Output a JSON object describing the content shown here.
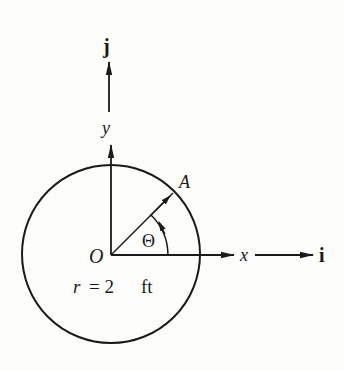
{
  "diagram": {
    "type": "geometry",
    "labels": {
      "unit_j": "j",
      "axis_y": "y",
      "point_A": "A",
      "angle": "Θ",
      "origin": "O",
      "axis_x": "x",
      "unit_i": "i",
      "radius_r": "r",
      "radius_eq": "= 2",
      "radius_unit": "ft"
    },
    "values": {
      "radius": 2,
      "radius_unit": "ft"
    },
    "colors": {
      "ink": "#1a1a1a",
      "background": "#fdfdfb"
    }
  }
}
